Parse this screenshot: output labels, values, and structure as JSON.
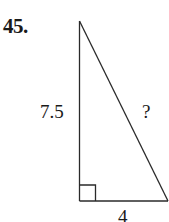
{
  "problem": {
    "number": "45.",
    "top_partial_text": "‑‑",
    "figure": {
      "type": "right-triangle",
      "vertical_leg_label": "7.5",
      "hypotenuse_label": "?",
      "horizontal_leg_label": "4",
      "right_angle_marker": true,
      "stroke_color": "#2a2a2a"
    }
  }
}
